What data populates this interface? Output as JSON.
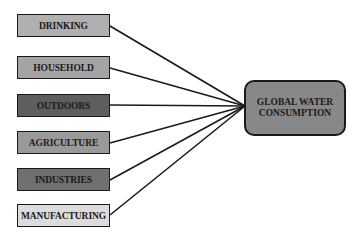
{
  "diagram": {
    "sources": [
      {
        "label": "DRINKING",
        "fill": "#b0b0b0",
        "top": 14,
        "anchor_y": 26
      },
      {
        "label": "HOUSEHOLD",
        "fill": "#a4a4a4",
        "top": 56,
        "anchor_y": 68
      },
      {
        "label": "OUTDOORS",
        "fill": "#5e5e5e",
        "top": 94,
        "anchor_y": 105
      },
      {
        "label": "AGRICULTURE",
        "fill": "#9a9a9a",
        "top": 131,
        "anchor_y": 143
      },
      {
        "label": "INDUSTRIES",
        "fill": "#707070",
        "top": 168,
        "anchor_y": 180
      },
      {
        "label": "MANUFACTURING",
        "fill": "#dcdcdc",
        "top": 204,
        "anchor_y": 215
      }
    ],
    "target": {
      "line1": "GLOBAL WATER",
      "line2": "CONSUMPTION",
      "fill": "#888888"
    },
    "convergence": {
      "x": 245,
      "y": 106
    },
    "line_color": "#1a1a1a"
  }
}
